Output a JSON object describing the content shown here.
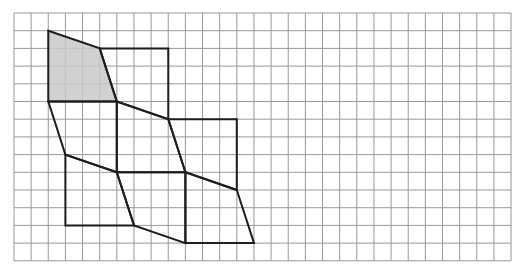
{
  "diagram": {
    "type": "grid-tessellation",
    "grid": {
      "cols": 29,
      "rows": 14,
      "origin_x": 14,
      "origin_y": 13,
      "cell_w": 17.14,
      "cell_h": 17.7,
      "line_color": "#9a9a9a",
      "line_width": 1
    },
    "shape_style": {
      "stroke": "#1e1e1e",
      "stroke_width": 2,
      "shade_fill": "#c9c9c9"
    },
    "shapes": [
      {
        "id": "A",
        "shaded": true,
        "points": [
          [
            2,
            1
          ],
          [
            5,
            2
          ],
          [
            6,
            5
          ],
          [
            2,
            5
          ]
        ]
      },
      {
        "id": "B",
        "shaded": false,
        "points": [
          [
            5,
            2
          ],
          [
            9,
            2
          ],
          [
            9,
            6
          ],
          [
            6,
            5
          ]
        ]
      },
      {
        "id": "C",
        "shaded": false,
        "points": [
          [
            2,
            5
          ],
          [
            6,
            5
          ],
          [
            6,
            9
          ],
          [
            3,
            8
          ]
        ]
      },
      {
        "id": "D",
        "shaded": false,
        "points": [
          [
            6,
            5
          ],
          [
            9,
            6
          ],
          [
            10,
            9
          ],
          [
            6,
            9
          ]
        ]
      },
      {
        "id": "E",
        "shaded": false,
        "points": [
          [
            9,
            6
          ],
          [
            13,
            6
          ],
          [
            13,
            10
          ],
          [
            10,
            9
          ]
        ]
      },
      {
        "id": "F",
        "shaded": false,
        "points": [
          [
            3,
            8
          ],
          [
            6,
            9
          ],
          [
            7,
            12
          ],
          [
            3,
            12
          ]
        ]
      },
      {
        "id": "G",
        "shaded": false,
        "points": [
          [
            6,
            9
          ],
          [
            10,
            9
          ],
          [
            10,
            13
          ],
          [
            7,
            12
          ]
        ]
      },
      {
        "id": "H",
        "shaded": false,
        "points": [
          [
            10,
            9
          ],
          [
            13,
            10
          ],
          [
            14,
            13
          ],
          [
            10,
            13
          ]
        ]
      }
    ]
  }
}
